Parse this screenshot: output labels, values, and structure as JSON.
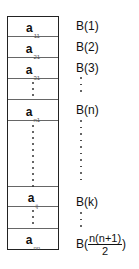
{
  "storage_array": {
    "cells": [
      {
        "base": "a",
        "sub": "11"
      },
      {
        "base": "a",
        "sub": "21"
      },
      {
        "base": "a",
        "sub": "31"
      },
      {
        "dots": true
      },
      {
        "base": "a",
        "sub": "n1"
      },
      {
        "dots": true
      },
      {
        "base": "a",
        "sub": "ij"
      },
      {
        "dots": true
      },
      {
        "base": "a",
        "sub": "nn"
      }
    ]
  },
  "index_labels": {
    "b1": "B(1)",
    "b2": "B(2)",
    "b3": "B(3)",
    "bn": "B(n)",
    "bk": "B(k)",
    "blast_prefix": "B(",
    "blast_num": "n(n+1)",
    "blast_den": "2",
    "blast_suffix": ")"
  }
}
